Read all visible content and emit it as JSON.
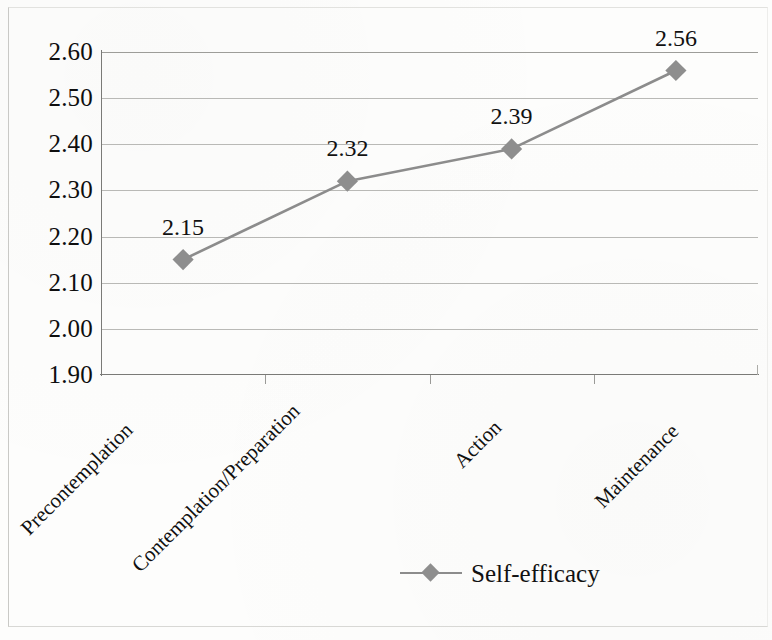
{
  "chart_data": {
    "type": "line",
    "title": "",
    "subtitle": "",
    "xlabel": "",
    "ylabel": "",
    "categories": [
      "Precontemplation",
      "Contemplation/Preparation",
      "Action",
      "Maintenance"
    ],
    "series": [
      {
        "name": "Self-efficacy",
        "values": [
          2.15,
          2.32,
          2.39,
          2.56
        ],
        "point_labels": [
          "2.15",
          "2.32",
          "2.39",
          "2.56"
        ],
        "color": "#8c8c8c",
        "marker": "diamond"
      }
    ],
    "ylim": [
      1.9,
      2.6
    ],
    "ytick_labels": [
      "2.60",
      "2.50",
      "2.40",
      "2.30",
      "2.20",
      "2.10",
      "2.00",
      "1.90"
    ],
    "ytick_values": [
      2.6,
      2.5,
      2.4,
      2.3,
      2.2,
      2.1,
      2.0,
      1.9
    ],
    "grid": true,
    "grid_axis": "y",
    "legend_position": "bottom",
    "data_labels_shown": true
  },
  "legend": {
    "entries": [
      {
        "label": "Self-efficacy",
        "marker_icon": "diamond-marker-icon",
        "color": "#8c8c8c"
      }
    ]
  },
  "colors": {
    "series_line": "#8c8c8c",
    "series_marker": "#8e8e8e",
    "gridline": "#b9b9b6",
    "axis": "#7a7a77",
    "text": "#111111",
    "background": "#fdfdfc"
  }
}
